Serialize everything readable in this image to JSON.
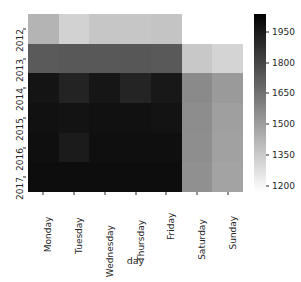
{
  "chart_data": {
    "type": "heatmap",
    "title": "",
    "xlabel": "day",
    "ylabel": "",
    "xtick_labels": [
      "Monday",
      "Tuesday",
      "Wednesday",
      "Thursday",
      "Friday",
      "Saturday",
      "Sunday"
    ],
    "ytick_labels": [
      "2012",
      "2013",
      "2014",
      "2015",
      "2016",
      "2017"
    ],
    "colorbar": {
      "tick_labels": [
        "1950",
        "1800",
        "1650",
        "1500",
        "1350",
        "1200"
      ],
      "tick_values": [
        1950,
        1800,
        1650,
        1500,
        1350,
        1200
      ],
      "vmin": 1170,
      "vmax": 2037,
      "cmap": "gray_reversed",
      "low_color": "#ffffff",
      "high_color": "#000000",
      "position": "right",
      "orientation": "vertical"
    },
    "grid": false,
    "legend": "colorbar",
    "nan_color": "#ffffff",
    "rows": [
      {
        "year": "2012",
        "values": [
          1395,
          1285,
          1330,
          1330,
          1340,
          null,
          null
        ],
        "colors": [
          "#b4b4b4",
          "#d2d2d2",
          "#c6c6c6",
          "#c6c6c6",
          "#c4c4c4",
          "#ffffff",
          "#ffffff"
        ]
      },
      {
        "year": "2013",
        "values": [
          1690,
          1700,
          1700,
          1705,
          1695,
          1330,
          1300
        ],
        "colors": [
          "#5a5a5a",
          "#585858",
          "#585858",
          "#575757",
          "#595959",
          "#c8c8c8",
          "#d4d4d4"
        ]
      },
      {
        "year": "2014",
        "values": [
          2010,
          1960,
          2005,
          1955,
          2000,
          1540,
          1490
        ],
        "colors": [
          "#141414",
          "#232323",
          "#161616",
          "#242424",
          "#181818",
          "#8a8a8a",
          "#9a9a9a"
        ]
      },
      {
        "year": "2015",
        "values": [
          2020,
          2015,
          2020,
          2020,
          2015,
          1530,
          1470
        ],
        "colors": [
          "#111111",
          "#131313",
          "#111111",
          "#111111",
          "#131313",
          "#8d8d8d",
          "#9f9f9f"
        ]
      },
      {
        "year": "2016",
        "values": [
          2025,
          1985,
          2025,
          2025,
          2025,
          1525,
          1465
        ],
        "colors": [
          "#0f0f0f",
          "#1b1b1b",
          "#0f0f0f",
          "#0f0f0f",
          "#0f0f0f",
          "#8e8e8e",
          "#a1a1a1"
        ]
      },
      {
        "year": "2017",
        "values": [
          2030,
          2030,
          2030,
          2030,
          2030,
          1520,
          1460
        ],
        "colors": [
          "#0d0d0d",
          "#0d0d0d",
          "#0d0d0d",
          "#0d0d0d",
          "#0d0d0d",
          "#909090",
          "#a3a3a3"
        ]
      }
    ]
  }
}
